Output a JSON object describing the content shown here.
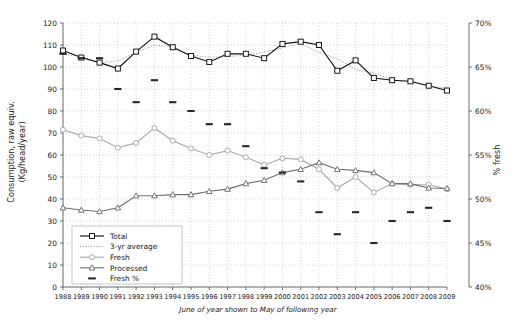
{
  "chart_data": {
    "type": "line",
    "title": "",
    "xlabel": "June of year shown to May of following year",
    "ylabel": "Consumption, raw equiv. (Kg/head/year)",
    "y2label": "% fresh",
    "xlim": [
      1988,
      2009
    ],
    "ylim": [
      0,
      120
    ],
    "y2lim": [
      40,
      70
    ],
    "grid": true,
    "legend_position": "inside-lower-left",
    "categories": [
      1988,
      1989,
      1990,
      1991,
      1992,
      1993,
      1994,
      1995,
      1996,
      1997,
      1998,
      1999,
      2000,
      2001,
      2002,
      2003,
      2004,
      2005,
      2006,
      2007,
      2008,
      2009
    ],
    "ytick_labels": [
      "0",
      "10",
      "20",
      "30",
      "40",
      "50",
      "60",
      "70",
      "80",
      "90",
      "100",
      "110",
      "120"
    ],
    "y2tick_labels": [
      "40%",
      "45%",
      "50%",
      "55%",
      "60%",
      "65%",
      "70%"
    ],
    "xtick_labels": [
      "1988",
      "1989",
      "1990",
      "1991",
      "1992",
      "1993",
      "1994",
      "1995",
      "1996",
      "1997",
      "1998",
      "1999",
      "2000",
      "2001",
      "2002",
      "2003",
      "2004",
      "2005",
      "2006",
      "2007",
      "2008",
      "2009"
    ],
    "series": [
      {
        "name": "Total",
        "marker": "square",
        "axis": "left",
        "values": [
          107.5,
          104.3,
          102.0,
          99.3,
          107.0,
          113.8,
          109.0,
          105.0,
          102.3,
          106.0,
          106.0,
          104.0,
          110.5,
          111.5,
          110.0,
          98.3,
          103.0,
          95.0,
          94.0,
          93.5,
          91.5,
          89.3
        ]
      },
      {
        "name": "3-yr average",
        "marker": "none",
        "axis": "left",
        "values": [
          106.0,
          104.6,
          101.9,
          102.8,
          106.7,
          109.9,
          109.3,
          105.4,
          104.4,
          104.8,
          105.3,
          106.8,
          108.7,
          110.7,
          106.6,
          103.8,
          98.8,
          97.3,
          94.2,
          93.0,
          91.4,
          90.4
        ]
      },
      {
        "name": "Fresh",
        "marker": "circle",
        "axis": "left",
        "values": [
          71.5,
          68.8,
          67.5,
          63.3,
          65.5,
          72.3,
          66.5,
          63.0,
          60.0,
          62.0,
          59.0,
          55.5,
          58.5,
          58.0,
          53.5,
          45.0,
          50.0,
          43.0,
          47.0,
          46.5,
          46.5,
          44.5
        ]
      },
      {
        "name": "Processed",
        "marker": "triangle",
        "axis": "left",
        "values": [
          36.0,
          35.0,
          34.3,
          36.0,
          41.5,
          41.5,
          42.0,
          42.0,
          43.5,
          44.5,
          47.0,
          48.5,
          52.0,
          53.5,
          56.5,
          53.5,
          53.0,
          52.0,
          47.0,
          47.0,
          45.0,
          44.8
        ]
      },
      {
        "name": "Fresh %",
        "marker": "dash",
        "axis": "right",
        "values": [
          66.5,
          66.0,
          66.0,
          62.5,
          61.0,
          63.5,
          61.0,
          60.0,
          58.5,
          58.5,
          56.0,
          53.5,
          53.0,
          52.0,
          48.5,
          46.0,
          48.5,
          45.0,
          47.5,
          48.5,
          49.0,
          47.5
        ]
      }
    ]
  },
  "legend": {
    "items": [
      {
        "label": "Total"
      },
      {
        "label": "3-yr average"
      },
      {
        "label": "Fresh"
      },
      {
        "label": "Processed"
      },
      {
        "label": "Fresh %"
      }
    ]
  },
  "colors": {
    "total": "#111111",
    "average": "#9a9a9a",
    "fresh": "#a8a8a8",
    "processed": "#6f6f6f",
    "fresh_pct": "#262626",
    "grid": "#bdbdbd",
    "axis": "#4d4d4d",
    "background": "#ffffff"
  }
}
